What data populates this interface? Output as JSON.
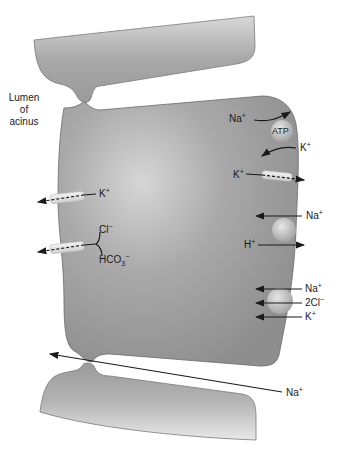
{
  "figure": {
    "type": "physiology-diagram"
  },
  "labels": {
    "lumen_line1": "Lumen",
    "lumen_line2": "of",
    "lumen_line3": "acinus",
    "atp": "ATP"
  },
  "transports": {
    "pump_na": "Na",
    "pump_na_charge": "+",
    "pump_k": "K",
    "pump_k_charge": "+",
    "basal_k_channel": "K",
    "basal_k_channel_charge": "+",
    "apical_k_channel": "K",
    "apical_k_channel_charge": "+",
    "cl": "Cl",
    "cl_charge": "−",
    "hco3": "HCO",
    "hco3_sub": "3",
    "hco3_charge": "−",
    "antiport_na": "Na",
    "antiport_na_charge": "+",
    "antiport_h": "H",
    "antiport_h_charge": "+",
    "nkcc_na": "Na",
    "nkcc_na_charge": "+",
    "nkcc_cl": "2Cl",
    "nkcc_cl_charge": "−",
    "nkcc_k": "K",
    "nkcc_k_charge": "+",
    "paracellular_na": "Na",
    "paracellular_na_charge": "+"
  },
  "colors": {
    "cell": "#9c9c9c",
    "cell_highlight": "#d2d2d2",
    "outline": "#6a6a6a",
    "arrow": "#1a1a1a",
    "background": "#ffffff"
  }
}
